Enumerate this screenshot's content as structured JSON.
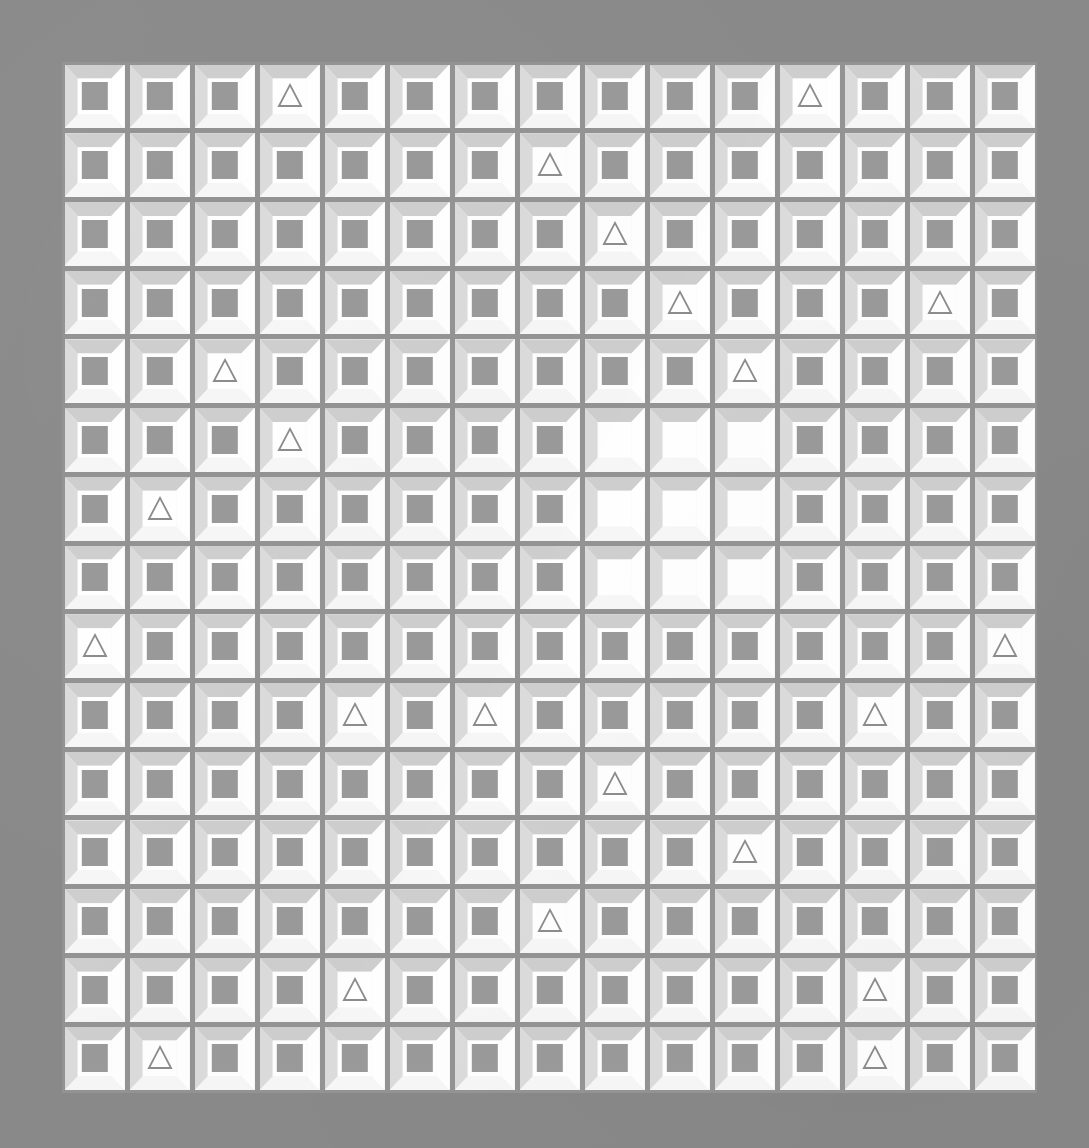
{
  "artwork": {
    "title": "Beveled Tile Grid",
    "description": "Op-art style grid of embossed square tiles. Most tiles contain a solid grey square; scattered tiles contain an outlined triangle; a 3x3 block of tiles near the centre-right is blank.",
    "grid": {
      "rows": 15,
      "columns": 15,
      "cell_width_px": 65,
      "cell_height_px": 69,
      "origin_x_px": 62,
      "origin_y_px": 62
    },
    "glyph_names": {
      "square": "filled-square-glyph",
      "triangle": "outline-triangle-glyph",
      "empty": "blank-tile"
    },
    "colors": {
      "background": "#8a8a8a",
      "seam": "#949494",
      "bevel_top": "#cfcfcf",
      "bevel_left": "#dcdcdc",
      "bevel_right": "#ffffff",
      "bevel_bottom": "#f7f7f7",
      "tile_field": "#ffffff",
      "square_fill": "#9a9a9a",
      "triangle_stroke": "#8d8d8d"
    },
    "counts": {
      "total_tiles": 225,
      "squares": 197,
      "triangles": 19,
      "blank": 9
    },
    "blank_block": {
      "rows": [
        6,
        7,
        8
      ],
      "columns": [
        9,
        10,
        11
      ]
    },
    "triangle_positions": [
      {
        "row": 1,
        "col": 4
      },
      {
        "row": 1,
        "col": 12
      },
      {
        "row": 2,
        "col": 8
      },
      {
        "row": 3,
        "col": 9
      },
      {
        "row": 4,
        "col": 10
      },
      {
        "row": 4,
        "col": 14
      },
      {
        "row": 5,
        "col": 3
      },
      {
        "row": 5,
        "col": 11
      },
      {
        "row": 6,
        "col": 4
      },
      {
        "row": 7,
        "col": 2
      },
      {
        "row": 9,
        "col": 1
      },
      {
        "row": 9,
        "col": 15
      },
      {
        "row": 10,
        "col": 5
      },
      {
        "row": 10,
        "col": 7
      },
      {
        "row": 10,
        "col": 13
      },
      {
        "row": 11,
        "col": 9
      },
      {
        "row": 12,
        "col": 11
      },
      {
        "row": 13,
        "col": 8
      },
      {
        "row": 14,
        "col": 5
      },
      {
        "row": 14,
        "col": 13
      },
      {
        "row": 15,
        "col": 2
      },
      {
        "row": 15,
        "col": 13
      }
    ],
    "tiles": [
      [
        "square",
        "square",
        "square",
        "triangle",
        "square",
        "square",
        "square",
        "square",
        "square",
        "square",
        "square",
        "triangle",
        "square",
        "square",
        "square"
      ],
      [
        "square",
        "square",
        "square",
        "square",
        "square",
        "square",
        "square",
        "triangle",
        "square",
        "square",
        "square",
        "square",
        "square",
        "square",
        "square"
      ],
      [
        "square",
        "square",
        "square",
        "square",
        "square",
        "square",
        "square",
        "square",
        "triangle",
        "square",
        "square",
        "square",
        "square",
        "square",
        "square"
      ],
      [
        "square",
        "square",
        "square",
        "square",
        "square",
        "square",
        "square",
        "square",
        "square",
        "triangle",
        "square",
        "square",
        "square",
        "triangle",
        "square"
      ],
      [
        "square",
        "square",
        "triangle",
        "square",
        "square",
        "square",
        "square",
        "square",
        "square",
        "square",
        "triangle",
        "square",
        "square",
        "square",
        "square"
      ],
      [
        "square",
        "square",
        "square",
        "triangle",
        "square",
        "square",
        "square",
        "square",
        "empty",
        "empty",
        "empty",
        "square",
        "square",
        "square",
        "square"
      ],
      [
        "square",
        "triangle",
        "square",
        "square",
        "square",
        "square",
        "square",
        "square",
        "empty",
        "empty",
        "empty",
        "square",
        "square",
        "square",
        "square"
      ],
      [
        "square",
        "square",
        "square",
        "square",
        "square",
        "square",
        "square",
        "square",
        "empty",
        "empty",
        "empty",
        "square",
        "square",
        "square",
        "square"
      ],
      [
        "triangle",
        "square",
        "square",
        "square",
        "square",
        "square",
        "square",
        "square",
        "square",
        "square",
        "square",
        "square",
        "square",
        "square",
        "triangle"
      ],
      [
        "square",
        "square",
        "square",
        "square",
        "triangle",
        "square",
        "triangle",
        "square",
        "square",
        "square",
        "square",
        "square",
        "triangle",
        "square",
        "square"
      ],
      [
        "square",
        "square",
        "square",
        "square",
        "square",
        "square",
        "square",
        "square",
        "triangle",
        "square",
        "square",
        "square",
        "square",
        "square",
        "square"
      ],
      [
        "square",
        "square",
        "square",
        "square",
        "square",
        "square",
        "square",
        "square",
        "square",
        "square",
        "triangle",
        "square",
        "square",
        "square",
        "square"
      ],
      [
        "square",
        "square",
        "square",
        "square",
        "square",
        "square",
        "square",
        "triangle",
        "square",
        "square",
        "square",
        "square",
        "square",
        "square",
        "square"
      ],
      [
        "square",
        "square",
        "square",
        "square",
        "triangle",
        "square",
        "square",
        "square",
        "square",
        "square",
        "square",
        "square",
        "triangle",
        "square",
        "square"
      ],
      [
        "square",
        "triangle",
        "square",
        "square",
        "square",
        "square",
        "square",
        "square",
        "square",
        "square",
        "square",
        "square",
        "triangle",
        "square",
        "square"
      ]
    ]
  }
}
